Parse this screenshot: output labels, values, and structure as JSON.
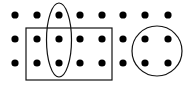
{
  "figure": {
    "width": 194,
    "height": 88,
    "background": "#ffffff",
    "stroke_color": "#111111",
    "dot_color": "#000000",
    "dot_radius": 3.6,
    "dot_grid": {
      "columns_x": [
        15,
        37,
        59,
        80,
        102,
        123,
        145,
        168
      ],
      "rows_y": [
        15,
        39,
        63
      ]
    },
    "shapes": [
      {
        "type": "ellipse",
        "name": "ellipse-column-3",
        "cx": 59,
        "cy": 40,
        "rx": 12.5,
        "ry": 37
      },
      {
        "type": "rect",
        "name": "rectangle-rows-2-3",
        "x": 26,
        "y": 28,
        "width": 86,
        "height": 52
      },
      {
        "type": "circle",
        "name": "circle-right-group",
        "cx": 157,
        "cy": 51,
        "r": 25
      }
    ]
  }
}
